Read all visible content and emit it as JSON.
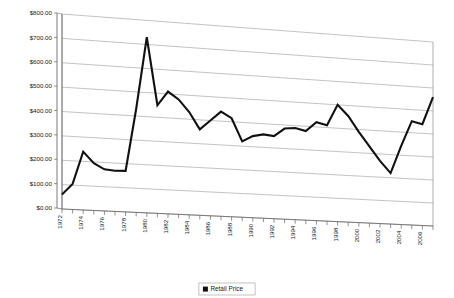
{
  "chart_data": {
    "type": "line",
    "title": "",
    "xlabel": "",
    "ylabel": "",
    "ylim": [
      0,
      800
    ],
    "ytick_step": 100,
    "ytick_labels": [
      "$0.00",
      "$100.00",
      "$200.00",
      "$300.00",
      "$400.00",
      "$500.00",
      "$600.00",
      "$700.00",
      "$800.00"
    ],
    "ytick_values": [
      0,
      100,
      200,
      300,
      400,
      500,
      600,
      700,
      800
    ],
    "grid": true,
    "grid_axis": "y",
    "three_d": true,
    "legend_position": "bottom",
    "legend": [
      "Retail Price"
    ],
    "xtick_labels": [
      "1972",
      "1974",
      "1976",
      "1978",
      "1980",
      "1982",
      "1984",
      "1986",
      "1988",
      "1990",
      "1992",
      "1994",
      "1996",
      "1998",
      "2000",
      "2002",
      "2004",
      "2006"
    ],
    "x": [
      1972,
      1973,
      1974,
      1975,
      1976,
      1977,
      1978,
      1979,
      1980,
      1981,
      1982,
      1983,
      1984,
      1985,
      1986,
      1987,
      1988,
      1989,
      1990,
      1991,
      1992,
      1993,
      1994,
      1995,
      1996,
      1997,
      1998,
      1999,
      2000,
      2001,
      2002,
      2003,
      2004,
      2005,
      2006,
      2007
    ],
    "series": [
      {
        "name": "Retail Price",
        "color": "#111111",
        "values": [
          60,
          105,
          240,
          195,
          172,
          168,
          170,
          430,
          730,
          450,
          510,
          480,
          430,
          360,
          400,
          440,
          415,
          320,
          345,
          355,
          350,
          385,
          390,
          380,
          420,
          410,
          500,
          455,
          390,
          330,
          270,
          220,
          340,
          450,
          440,
          560
        ]
      }
    ]
  },
  "axes": {
    "y_axis_name": "retail-price-axis",
    "x_axis_name": "year-axis"
  },
  "legend": {
    "entries": [
      {
        "label": "Retail Price",
        "color": "#111111"
      }
    ]
  }
}
